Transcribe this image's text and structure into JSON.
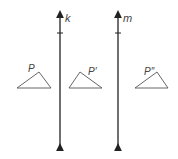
{
  "diagram": {
    "lines": [
      {
        "label": "k",
        "x": 60
      },
      {
        "label": "m",
        "x": 118
      }
    ],
    "triangles": [
      {
        "label": "P",
        "points": "17,88 39,72 51,88",
        "label_x": 28,
        "label_y": 70
      },
      {
        "label": "P′",
        "points": "69,88 80,72 102,88",
        "label_x": 88,
        "label_y": 74
      },
      {
        "label": "P″",
        "points": "135,88 157,72 168,88",
        "label_x": 144,
        "label_y": 74
      }
    ],
    "colors": {
      "line": "#222222",
      "triangle": "#555555",
      "text": "#444444"
    }
  }
}
